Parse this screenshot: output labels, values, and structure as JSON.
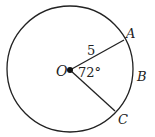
{
  "diagram": {
    "center_label": "O",
    "point_a": "A",
    "point_b": "B",
    "point_c": "C",
    "radius_label": "5",
    "angle_label": "72°"
  }
}
